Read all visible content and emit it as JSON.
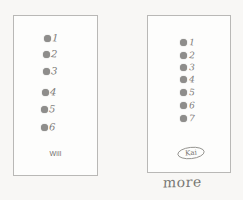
{
  "page": {
    "background_color": "#f8f7f5",
    "ink_color": "#7d7c7a",
    "dot_color": "#8e8d8b",
    "card_border_color": "#b9b8b6"
  },
  "cards": [
    {
      "id": "left",
      "name_label": "Will",
      "dot_count": 6,
      "items": [
        {
          "dot": "filled-dot",
          "numeral": "1"
        },
        {
          "dot": "filled-dot",
          "numeral": "2"
        },
        {
          "dot": "filled-dot",
          "numeral": "3"
        },
        {
          "dot": "filled-dot",
          "numeral": "4"
        },
        {
          "dot": "filled-dot",
          "numeral": "5"
        },
        {
          "dot": "filled-dot",
          "numeral": "6"
        }
      ]
    },
    {
      "id": "right",
      "name_label": "Kai",
      "dot_count": 7,
      "items": [
        {
          "dot": "filled-dot",
          "numeral": "1"
        },
        {
          "dot": "filled-dot",
          "numeral": "2"
        },
        {
          "dot": "filled-dot",
          "numeral": "3"
        },
        {
          "dot": "filled-dot",
          "numeral": "4"
        },
        {
          "dot": "filled-dot",
          "numeral": "5"
        },
        {
          "dot": "filled-dot",
          "numeral": "6"
        },
        {
          "dot": "filled-dot",
          "numeral": "7"
        }
      ]
    }
  ],
  "caption": "more"
}
